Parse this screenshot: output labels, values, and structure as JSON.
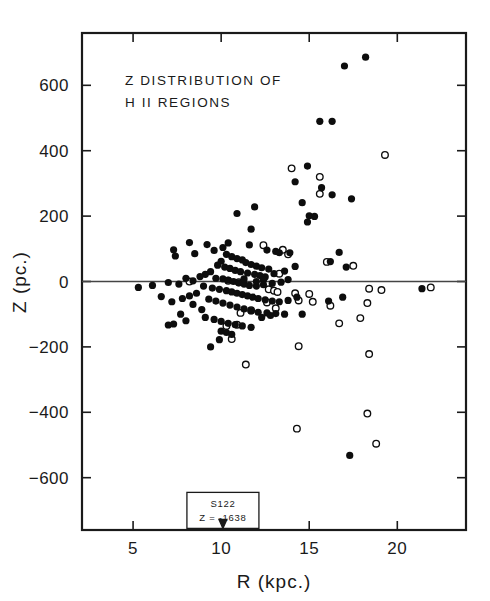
{
  "chart_data": {
    "type": "scatter",
    "title": [
      "Z DISTRIBUTION OF",
      "H II REGIONS"
    ],
    "xlabel": "R  (kpc.)",
    "ylabel": "Z  (pc.)",
    "xlim": [
      2.1,
      23.9
    ],
    "ylim": [
      -760,
      760
    ],
    "xticks": [
      5,
      10,
      15,
      20
    ],
    "xticklabels": [
      "5",
      "10",
      "15",
      "20"
    ],
    "yticks": [
      -600,
      -400,
      -200,
      0,
      200,
      400,
      600
    ],
    "yticklabels": [
      "-600",
      "-400",
      "-200",
      "0",
      "200",
      "400",
      "600"
    ],
    "grid": false,
    "legend": null,
    "zero_reference_line": 0,
    "annotation": {
      "line1": "S122",
      "line2": "Z = -1638",
      "x": 10.1,
      "box_y": -700,
      "arrow_to_y": -755
    },
    "series": [
      {
        "name": "filled",
        "marker": "filled-circle",
        "color": "#0d0d0d",
        "points": [
          [
            18.2,
            686
          ],
          [
            17.0,
            659
          ],
          [
            15.6,
            490
          ],
          [
            16.3,
            490
          ],
          [
            14.9,
            353
          ],
          [
            14.2,
            305
          ],
          [
            15.7,
            287
          ],
          [
            16.3,
            265
          ],
          [
            17.4,
            253
          ],
          [
            14.6,
            241
          ],
          [
            15.0,
            201
          ],
          [
            15.3,
            199
          ],
          [
            14.9,
            182
          ],
          [
            10.9,
            208
          ],
          [
            11.9,
            228
          ],
          [
            11.7,
            160
          ],
          [
            16.7,
            89
          ],
          [
            17.1,
            44
          ],
          [
            16.2,
            61
          ],
          [
            9.2,
            113
          ],
          [
            10.4,
            118
          ],
          [
            8.2,
            119
          ],
          [
            11.6,
            112
          ],
          [
            12.6,
            96
          ],
          [
            13.1,
            92
          ],
          [
            13.3,
            88
          ],
          [
            13.9,
            88
          ],
          [
            7.4,
            78
          ],
          [
            7.3,
            97
          ],
          [
            8.5,
            85
          ],
          [
            9.6,
            95
          ],
          [
            10.1,
            104
          ],
          [
            10.3,
            83
          ],
          [
            10.6,
            76
          ],
          [
            10.9,
            70
          ],
          [
            11.2,
            66
          ],
          [
            11.4,
            58
          ],
          [
            11.7,
            52
          ],
          [
            12.0,
            47
          ],
          [
            12.3,
            42
          ],
          [
            12.7,
            38
          ],
          [
            10.0,
            62
          ],
          [
            9.8,
            50
          ],
          [
            10.2,
            44
          ],
          [
            10.5,
            40
          ],
          [
            10.8,
            34
          ],
          [
            11.1,
            30
          ],
          [
            11.5,
            26
          ],
          [
            11.9,
            22
          ],
          [
            12.2,
            18
          ],
          [
            12.5,
            14
          ],
          [
            9.4,
            30
          ],
          [
            9.1,
            22
          ],
          [
            8.8,
            15
          ],
          [
            9.7,
            10
          ],
          [
            10.1,
            8
          ],
          [
            10.4,
            4
          ],
          [
            10.7,
            0
          ],
          [
            11.0,
            -4
          ],
          [
            11.3,
            -8
          ],
          [
            11.6,
            -12
          ],
          [
            12.0,
            -14
          ],
          [
            12.4,
            -10
          ],
          [
            12.9,
            -6
          ],
          [
            13.4,
            -2
          ],
          [
            13.8,
            6
          ],
          [
            8.0,
            10
          ],
          [
            8.4,
            2
          ],
          [
            7.0,
            -3
          ],
          [
            7.6,
            -8
          ],
          [
            6.1,
            -12
          ],
          [
            9.0,
            -14
          ],
          [
            9.5,
            -20
          ],
          [
            9.9,
            -24
          ],
          [
            10.3,
            -28
          ],
          [
            10.6,
            -32
          ],
          [
            10.9,
            -36
          ],
          [
            11.2,
            -40
          ],
          [
            11.5,
            -44
          ],
          [
            11.8,
            -48
          ],
          [
            12.1,
            -52
          ],
          [
            12.5,
            -56
          ],
          [
            12.9,
            -60
          ],
          [
            13.3,
            -62
          ],
          [
            13.8,
            -58
          ],
          [
            14.3,
            -48
          ],
          [
            8.6,
            -36
          ],
          [
            8.2,
            -44
          ],
          [
            7.8,
            -52
          ],
          [
            9.3,
            -54
          ],
          [
            9.7,
            -60
          ],
          [
            10.1,
            -66
          ],
          [
            10.5,
            -72
          ],
          [
            10.9,
            -78
          ],
          [
            11.3,
            -84
          ],
          [
            11.7,
            -90
          ],
          [
            12.1,
            -94
          ],
          [
            12.6,
            -96
          ],
          [
            13.1,
            -98
          ],
          [
            13.6,
            -100
          ],
          [
            14.6,
            -100
          ],
          [
            9.1,
            -110
          ],
          [
            9.6,
            -116
          ],
          [
            10.0,
            -122
          ],
          [
            10.4,
            -128
          ],
          [
            10.8,
            -132
          ],
          [
            11.2,
            -136
          ],
          [
            11.7,
            -140
          ],
          [
            12.3,
            -110
          ],
          [
            12.8,
            -104
          ],
          [
            7.0,
            -133
          ],
          [
            7.3,
            -130
          ],
          [
            8.4,
            -70
          ],
          [
            8.9,
            -86
          ],
          [
            10.0,
            -152
          ],
          [
            10.3,
            -156
          ],
          [
            10.6,
            -162
          ],
          [
            9.9,
            -178
          ],
          [
            9.4,
            -200
          ],
          [
            21.4,
            -22
          ],
          [
            17.3,
            -532
          ],
          [
            16.9,
            -48
          ],
          [
            16.1,
            -60
          ],
          [
            5.3,
            -18
          ],
          [
            6.6,
            -46
          ],
          [
            7.2,
            -62
          ],
          [
            7.7,
            -100
          ],
          [
            8.0,
            -120
          ],
          [
            12.0,
            0
          ],
          [
            12.4,
            4
          ],
          [
            11.3,
            8
          ],
          [
            13.0,
            24
          ],
          [
            13.6,
            32
          ],
          [
            14.2,
            46
          ]
        ]
      },
      {
        "name": "open",
        "marker": "open-circle",
        "color": "#0d0d0d",
        "points": [
          [
            19.3,
            387
          ],
          [
            15.6,
            320
          ],
          [
            15.6,
            268
          ],
          [
            14.0,
            346
          ],
          [
            12.4,
            111
          ],
          [
            13.5,
            97
          ],
          [
            13.8,
            83
          ],
          [
            16.0,
            60
          ],
          [
            17.5,
            48
          ],
          [
            13.3,
            24
          ],
          [
            8.2,
            0
          ],
          [
            10.4,
            2
          ],
          [
            11.0,
            -2
          ],
          [
            12.7,
            -24
          ],
          [
            13.0,
            -28
          ],
          [
            13.2,
            -32
          ],
          [
            14.2,
            -36
          ],
          [
            15.0,
            -38
          ],
          [
            18.4,
            -22
          ],
          [
            19.1,
            -26
          ],
          [
            21.9,
            -18
          ],
          [
            14.4,
            -58
          ],
          [
            15.2,
            -62
          ],
          [
            16.2,
            -74
          ],
          [
            18.3,
            -66
          ],
          [
            13.1,
            -82
          ],
          [
            11.7,
            -88
          ],
          [
            10.9,
            -132
          ],
          [
            10.3,
            -136
          ],
          [
            10.6,
            -176
          ],
          [
            11.4,
            -254
          ],
          [
            14.4,
            -198
          ],
          [
            18.4,
            -222
          ],
          [
            16.7,
            -128
          ],
          [
            18.3,
            -404
          ],
          [
            14.3,
            -450
          ],
          [
            18.8,
            -496
          ],
          [
            17.9,
            -112
          ],
          [
            12.6,
            -64
          ],
          [
            11.1,
            -96
          ]
        ]
      }
    ]
  }
}
